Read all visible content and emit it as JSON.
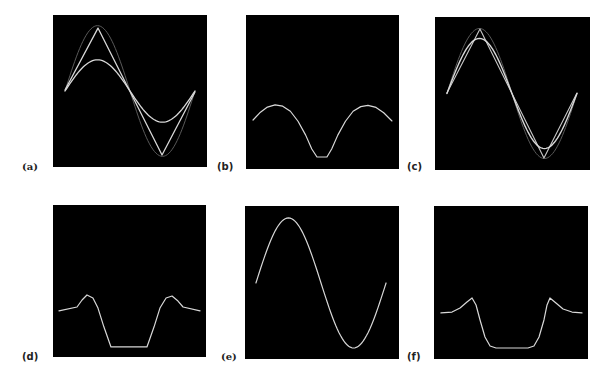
{
  "figure": {
    "panels": [
      {
        "id": "a",
        "label": "(a)",
        "box": [
          53,
          15,
          154,
          152
        ],
        "label_pos": [
          22,
          162
        ],
        "label_font": "serif"
      },
      {
        "id": "b",
        "label": "(b)",
        "box": [
          246,
          15,
          153,
          154
        ],
        "label_pos": [
          217,
          162
        ],
        "label_font": "sans"
      },
      {
        "id": "c",
        "label": "(c)",
        "box": [
          435,
          17,
          155,
          153
        ],
        "label_pos": [
          407,
          162
        ],
        "label_font": "sans"
      },
      {
        "id": "d",
        "label": "(d)",
        "box": [
          53,
          205,
          153,
          152
        ],
        "label_pos": [
          22,
          352
        ],
        "label_font": "sans"
      },
      {
        "id": "e",
        "label": "(e)",
        "box": [
          245,
          206,
          154,
          153
        ],
        "label_pos": [
          221,
          352
        ],
        "label_font": "serif"
      },
      {
        "id": "f",
        "label": "(f)",
        "box": [
          434,
          206,
          154,
          153
        ],
        "label_pos": [
          407,
          352
        ],
        "label_font": "sans"
      }
    ]
  },
  "chart_data": [
    {
      "panel": "a",
      "type": "line",
      "title": "(a)",
      "xlabel": "",
      "ylabel": "",
      "grid": false,
      "background": "#000000",
      "series": [
        {
          "name": "true sine (faint)",
          "kind": "sine",
          "x0": 0.078,
          "x1": 0.922,
          "center": 0.5,
          "amp": 0.43,
          "color": "#5a5a5a",
          "width": 1
        },
        {
          "name": "piecewise-linear approximation",
          "kind": "points",
          "color": "#d8d8d8",
          "width": 1.3,
          "points": [
            [
              0.078,
              0.493
            ],
            [
              0.292,
              0.086
            ],
            [
              0.708,
              0.921
            ],
            [
              0.922,
              0.507
            ]
          ]
        },
        {
          "name": "smoothed approximation",
          "kind": "sine",
          "x0": 0.078,
          "x1": 0.922,
          "center": 0.5,
          "amp": 0.205,
          "color": "#d8d8d8",
          "width": 1.3
        }
      ]
    },
    {
      "panel": "b",
      "type": "line",
      "title": "(b)",
      "xlabel": "",
      "ylabel": "",
      "grid": false,
      "background": "#000000",
      "series": [
        {
          "name": "error curve",
          "kind": "points",
          "color": "#d8d8d8",
          "width": 1.2,
          "points": [
            [
              0.046,
              0.682
            ],
            [
              0.09,
              0.635
            ],
            [
              0.14,
              0.598
            ],
            [
              0.19,
              0.584
            ],
            [
              0.24,
              0.592
            ],
            [
              0.29,
              0.625
            ],
            [
              0.34,
              0.69
            ],
            [
              0.39,
              0.78
            ],
            [
              0.43,
              0.87
            ],
            [
              0.464,
              0.922
            ],
            [
              0.529,
              0.922
            ],
            [
              0.56,
              0.87
            ],
            [
              0.6,
              0.78
            ],
            [
              0.65,
              0.69
            ],
            [
              0.7,
              0.625
            ],
            [
              0.75,
              0.595
            ],
            [
              0.797,
              0.587
            ],
            [
              0.85,
              0.6
            ],
            [
              0.9,
              0.635
            ],
            [
              0.954,
              0.688
            ]
          ]
        }
      ]
    },
    {
      "panel": "c",
      "type": "line",
      "title": "(c)",
      "xlabel": "",
      "ylabel": "",
      "grid": false,
      "background": "#000000",
      "series": [
        {
          "name": "true sine (faint)",
          "kind": "sine",
          "x0": 0.077,
          "x1": 0.916,
          "center": 0.5,
          "amp": 0.425,
          "color": "#5a5a5a",
          "width": 1
        },
        {
          "name": "piecewise-linear approximation",
          "kind": "points",
          "color": "#c8c8c8",
          "width": 1.1,
          "points": [
            [
              0.077,
              0.497
            ],
            [
              0.29,
              0.078
            ],
            [
              0.703,
              0.922
            ],
            [
              0.916,
              0.497
            ]
          ]
        },
        {
          "name": "smoothed approximation",
          "kind": "sine",
          "x0": 0.077,
          "x1": 0.916,
          "center": 0.5,
          "amp": 0.36,
          "color": "#d8d8d8",
          "width": 1.4
        }
      ]
    },
    {
      "panel": "d",
      "type": "line",
      "title": "(d)",
      "xlabel": "",
      "ylabel": "",
      "grid": false,
      "background": "#000000",
      "series": [
        {
          "name": "error curve",
          "kind": "points",
          "color": "#d8d8d8",
          "width": 1.2,
          "points": [
            [
              0.039,
              0.697
            ],
            [
              0.157,
              0.671
            ],
            [
              0.19,
              0.625
            ],
            [
              0.222,
              0.592
            ],
            [
              0.261,
              0.612
            ],
            [
              0.294,
              0.678
            ],
            [
              0.333,
              0.803
            ],
            [
              0.379,
              0.934
            ],
            [
              0.614,
              0.934
            ],
            [
              0.66,
              0.803
            ],
            [
              0.699,
              0.678
            ],
            [
              0.739,
              0.612
            ],
            [
              0.778,
              0.599
            ],
            [
              0.817,
              0.632
            ],
            [
              0.85,
              0.671
            ],
            [
              0.961,
              0.697
            ]
          ]
        }
      ]
    },
    {
      "panel": "e",
      "type": "line",
      "title": "(e)",
      "xlabel": "",
      "ylabel": "",
      "grid": false,
      "background": "#000000",
      "series": [
        {
          "name": "sine",
          "kind": "sine",
          "x0": 0.071,
          "x1": 0.916,
          "center": 0.503,
          "amp": 0.425,
          "color": "#d8d8d8",
          "width": 1.2
        }
      ]
    },
    {
      "panel": "f",
      "type": "line",
      "title": "(f)",
      "xlabel": "",
      "ylabel": "",
      "grid": false,
      "background": "#000000",
      "series": [
        {
          "name": "error curve",
          "kind": "points",
          "color": "#d8d8d8",
          "width": 1.2,
          "points": [
            [
              0.045,
              0.699
            ],
            [
              0.117,
              0.693
            ],
            [
              0.169,
              0.667
            ],
            [
              0.214,
              0.627
            ],
            [
              0.247,
              0.601
            ],
            [
              0.273,
              0.647
            ],
            [
              0.299,
              0.745
            ],
            [
              0.331,
              0.856
            ],
            [
              0.364,
              0.915
            ],
            [
              0.403,
              0.928
            ],
            [
              0.61,
              0.928
            ],
            [
              0.649,
              0.915
            ],
            [
              0.682,
              0.856
            ],
            [
              0.714,
              0.745
            ],
            [
              0.734,
              0.647
            ],
            [
              0.753,
              0.601
            ],
            [
              0.792,
              0.634
            ],
            [
              0.838,
              0.673
            ],
            [
              0.896,
              0.693
            ],
            [
              0.961,
              0.699
            ]
          ]
        }
      ]
    }
  ]
}
